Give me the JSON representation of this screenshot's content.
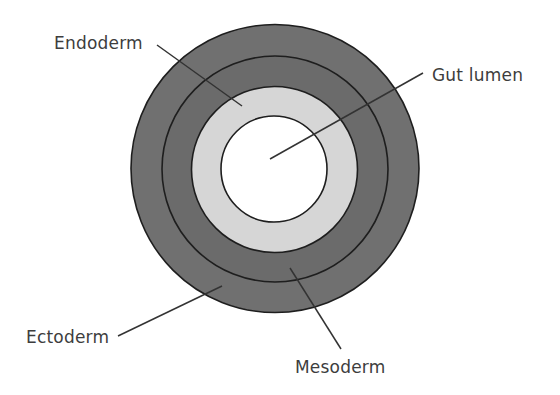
{
  "diagram": {
    "colors": {
      "background": "#ffffff",
      "ectoderm_fill": "#707070",
      "mesoderm_fill": "#6b6b6b",
      "endoderm_fill": "#d6d6d6",
      "lumen_fill": "#ffffff",
      "outline": "#1e1e1e",
      "text": "#3d3d3d"
    },
    "center": {
      "x": 275,
      "y": 168
    },
    "rings": [
      {
        "name": "ectoderm",
        "outer_radius": 144
      },
      {
        "name": "mesoderm",
        "outer_radius": 113
      },
      {
        "name": "endoderm",
        "outer_radius": 83
      },
      {
        "name": "gut_lumen",
        "outer_radius": 53
      }
    ],
    "labels": {
      "endoderm": "Endoderm",
      "gut_lumen": "Gut lumen",
      "ectoderm": "Ectoderm",
      "mesoderm": "Mesoderm"
    }
  }
}
